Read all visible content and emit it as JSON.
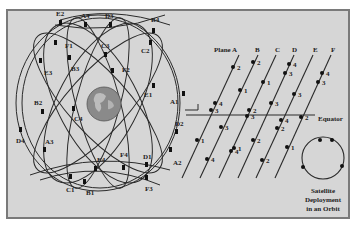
{
  "caption_cutoff": "······················",
  "globe": {
    "satellites": [
      {
        "label": "E2",
        "x": 62,
        "y": 14
      },
      {
        "label": "A4",
        "x": 84,
        "y": 16
      },
      {
        "label": "D3",
        "x": 110,
        "y": 16
      },
      {
        "label": "B4",
        "x": 155,
        "y": 20
      },
      {
        "label": "F1",
        "x": 68,
        "y": 45
      },
      {
        "label": "C3",
        "x": 105,
        "y": 45
      },
      {
        "label": "C2",
        "x": 145,
        "y": 50
      },
      {
        "label": "E3",
        "x": 45,
        "y": 72
      },
      {
        "label": "B3",
        "x": 72,
        "y": 68
      },
      {
        "label": "F2",
        "x": 124,
        "y": 70
      },
      {
        "label": "E1",
        "x": 148,
        "y": 94
      },
      {
        "label": "A1",
        "x": 172,
        "y": 101
      },
      {
        "label": "B2",
        "x": 38,
        "y": 104
      },
      {
        "label": "C4",
        "x": 76,
        "y": 121
      },
      {
        "label": "D2",
        "x": 176,
        "y": 124
      },
      {
        "label": "D4",
        "x": 20,
        "y": 141
      },
      {
        "label": "A3",
        "x": 48,
        "y": 142
      },
      {
        "label": "A2",
        "x": 176,
        "y": 163
      },
      {
        "label": "E4",
        "x": 98,
        "y": 160
      },
      {
        "label": "F4",
        "x": 123,
        "y": 155
      },
      {
        "label": "D1",
        "x": 146,
        "y": 157
      },
      {
        "label": "C1",
        "x": 69,
        "y": 190
      },
      {
        "label": "B1",
        "x": 88,
        "y": 193
      },
      {
        "label": "F3",
        "x": 148,
        "y": 189
      }
    ]
  },
  "planes": {
    "labels": [
      "Plane A",
      "B",
      "C",
      "D",
      "E",
      "F"
    ],
    "equator_label": "Equator",
    "points": [
      {
        "plane": "A",
        "n": "2",
        "x": 232,
        "y": 67
      },
      {
        "plane": "A",
        "n": "4",
        "x": 215,
        "y": 102
      },
      {
        "plane": "A",
        "n": "3",
        "x": 210,
        "y": 110
      },
      {
        "plane": "A",
        "n": "1",
        "x": 197,
        "y": 139
      },
      {
        "plane": "A",
        "n": "4",
        "x": 184,
        "y": 171
      },
      {
        "plane": "B",
        "n": "2",
        "x": 253,
        "y": 62
      },
      {
        "plane": "B",
        "n": "1",
        "x": 240,
        "y": 90
      },
      {
        "plane": "B",
        "n": "2",
        "x": 249,
        "y": 110
      },
      {
        "plane": "B",
        "n": "3",
        "x": 221,
        "y": 127
      },
      {
        "plane": "B",
        "n": "1",
        "x": 220,
        "y": 140
      },
      {
        "plane": "C",
        "n": "1",
        "x": 263,
        "y": 82
      },
      {
        "plane": "C",
        "n": "3",
        "x": 249,
        "y": 122
      },
      {
        "plane": "C",
        "n": "4",
        "x": 232,
        "y": 148
      },
      {
        "plane": "D",
        "n": "4",
        "x": 287,
        "y": 64
      },
      {
        "plane": "D",
        "n": "3",
        "x": 285,
        "y": 73
      },
      {
        "plane": "D",
        "n": "3",
        "x": 272,
        "y": 103
      },
      {
        "plane": "D",
        "n": "2",
        "x": 260,
        "y": 119
      },
      {
        "plane": "D",
        "n": "2",
        "x": 253,
        "y": 139
      },
      {
        "plane": "D",
        "n": "1",
        "x": 262,
        "y": 159
      },
      {
        "plane": "E",
        "n": "3",
        "x": 294,
        "y": 94
      },
      {
        "plane": "E",
        "n": "4",
        "x": 281,
        "y": 119
      },
      {
        "plane": "E",
        "n": "2",
        "x": 277,
        "y": 128
      },
      {
        "plane": "E",
        "n": "1",
        "x": 286,
        "y": 147
      },
      {
        "plane": "F",
        "n": "4",
        "x": 322,
        "y": 73
      },
      {
        "plane": "F",
        "n": "3",
        "x": 319,
        "y": 82
      },
      {
        "plane": "F",
        "n": "2",
        "x": 299,
        "y": 117
      }
    ]
  },
  "orbit_inset": {
    "caption_line1": "Satellite",
    "caption_line2": "Deployment",
    "caption_line3": "in an Orbit"
  }
}
